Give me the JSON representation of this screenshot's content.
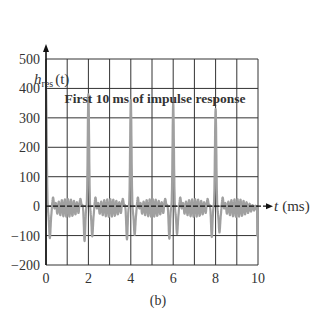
{
  "chart_data": {
    "type": "line",
    "title": "First 10 ms of impulse response",
    "ylabel_main": "h",
    "ylabel_sub": "res",
    "ylabel_arg": "(t)",
    "xlabel": "t (ms)",
    "caption": "(b)",
    "xlim": [
      0,
      10
    ],
    "ylim": [
      -200,
      500
    ],
    "xticks": [
      "0",
      "2",
      "4",
      "6",
      "8",
      "10"
    ],
    "yticks": [
      "500",
      "400",
      "300",
      "200",
      "100",
      "0",
      "−100",
      "−200"
    ],
    "grid": true,
    "line_color": "#a0a0a0",
    "peaks": [
      {
        "t": 0,
        "value": 400
      },
      {
        "t": 2,
        "value": 380
      },
      {
        "t": 4,
        "value": 360
      },
      {
        "t": 6,
        "value": 350
      },
      {
        "t": 8,
        "value": 330
      }
    ],
    "period_ms": 2,
    "ripple_amplitude": 30,
    "side_lobe_min": -110
  }
}
